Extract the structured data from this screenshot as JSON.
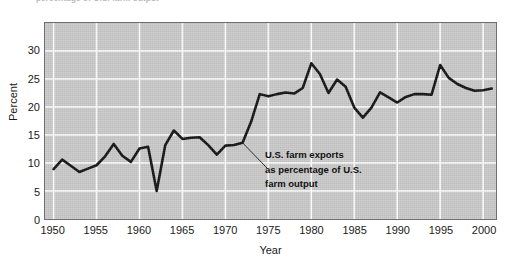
{
  "figure": {
    "clipped_caption": "percentage of U.S. farm output"
  },
  "chart_data": {
    "type": "line",
    "title": "",
    "xlabel": "Year",
    "ylabel": "Percent",
    "xlim": [
      1949,
      2001.5
    ],
    "ylim": [
      0,
      35
    ],
    "grid": true,
    "legend": "none",
    "x_ticks": [
      1950,
      1955,
      1960,
      1965,
      1970,
      1975,
      1980,
      1985,
      1990,
      1995,
      2000
    ],
    "x_tick_labels": [
      "1950",
      "1955",
      "1960",
      "1965",
      "1970",
      "1975",
      "1980",
      "1985",
      "1990",
      "1995",
      "2000"
    ],
    "y_ticks": [
      0,
      5,
      10,
      15,
      20,
      25,
      30
    ],
    "y_tick_labels": [
      "0",
      "5",
      "10",
      "15",
      "20",
      "25",
      "30"
    ],
    "annotations": [
      {
        "lines": [
          "U.S. farm exports",
          "as percentage of U.S.",
          "farm output"
        ],
        "points_to_x": 1972,
        "points_to_y": 13.6
      }
    ],
    "series": [
      {
        "name": "U.S. farm exports as percentage of U.S. farm output",
        "color": "#111111",
        "x": [
          1950,
          1951,
          1952,
          1953,
          1954,
          1955,
          1956,
          1957,
          1958,
          1959,
          1960,
          1961,
          1962,
          1963,
          1964,
          1965,
          1966,
          1967,
          1968,
          1969,
          1970,
          1971,
          1972,
          1973,
          1974,
          1975,
          1976,
          1977,
          1978,
          1979,
          1980,
          1981,
          1982,
          1983,
          1984,
          1985,
          1986,
          1987,
          1988,
          1989,
          1990,
          1991,
          1992,
          1993,
          1994,
          1995,
          1996,
          1997,
          1998,
          1999,
          2000,
          2001
        ],
        "values": [
          8.9,
          10.6,
          9.5,
          8.4,
          9.0,
          9.6,
          11.2,
          13.4,
          11.3,
          10.2,
          12.6,
          12.9,
          5.0,
          13.2,
          15.8,
          14.3,
          14.5,
          14.6,
          13.2,
          11.5,
          13.1,
          13.2,
          13.6,
          17.4,
          22.3,
          21.9,
          22.3,
          22.6,
          22.4,
          23.4,
          27.8,
          25.9,
          22.5,
          24.9,
          23.6,
          19.9,
          18.1,
          19.9,
          22.6,
          21.7,
          20.8,
          21.8,
          22.3,
          22.3,
          22.2,
          27.5,
          25.2,
          24.1,
          23.4,
          22.9,
          23.0,
          23.3
        ]
      }
    ]
  }
}
